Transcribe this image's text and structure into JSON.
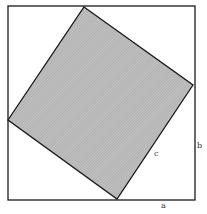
{
  "figure": {
    "type": "pythagorean-proof-diagram",
    "outer_square": {
      "x1": 8,
      "y1": 6,
      "x2": 195,
      "y2": 200
    },
    "inner_square": {
      "top": [
        84,
        7
      ],
      "right": [
        193,
        85
      ],
      "bottom": [
        117,
        199
      ],
      "left": [
        8,
        120
      ]
    },
    "colors": {
      "stroke": "#1a1a1a",
      "fill": "#bdbdbd",
      "hatch": "#8a8a8a",
      "background": "#ffffff"
    },
    "labels": {
      "a": "a",
      "b": "b",
      "c": "c"
    }
  }
}
